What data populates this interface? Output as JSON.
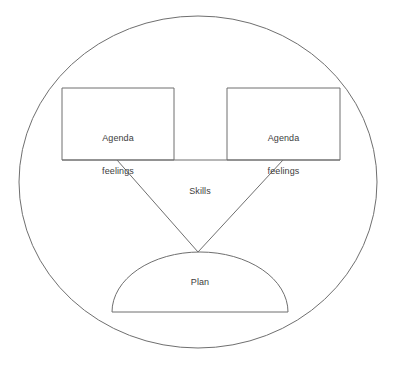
{
  "diagram": {
    "type": "concept-diagram",
    "background_color": "#ffffff",
    "stroke_color": "#6f6f6f",
    "text_color": "#3d3d3d",
    "container": {
      "shape": "ellipse",
      "name": "outer-ellipse",
      "cx": 198,
      "cy": 182,
      "rx": 179,
      "ry": 166,
      "label": ""
    },
    "nodes": [
      {
        "id": "box-left",
        "shape": "rectangle",
        "line1": "Agenda",
        "line2": "feelings",
        "x": 62,
        "y": 88,
        "width": 112,
        "height": 72
      },
      {
        "id": "box-right",
        "shape": "rectangle",
        "line1": "Agenda",
        "line2": "feelings",
        "x": 227,
        "y": 88,
        "width": 113,
        "height": 72
      },
      {
        "id": "dome-plan",
        "shape": "semicircle",
        "line1": "Plan",
        "cx": 200,
        "base_y": 312,
        "half_width": 88,
        "height": 60
      }
    ],
    "edge_label": {
      "id": "skills-label",
      "text": "Skills"
    },
    "connectors": [
      {
        "id": "left-connector",
        "from": "box-left",
        "to": "dome-plan",
        "x1": 117,
        "y1": 160,
        "x2": 198,
        "y2": 252
      },
      {
        "id": "right-connector",
        "from": "box-right",
        "to": "dome-plan",
        "x1": 283,
        "y1": 160,
        "x2": 198,
        "y2": 252
      }
    ],
    "baseline": {
      "id": "boxes-baseline",
      "x1": 62,
      "x2": 340,
      "y": 160
    }
  }
}
